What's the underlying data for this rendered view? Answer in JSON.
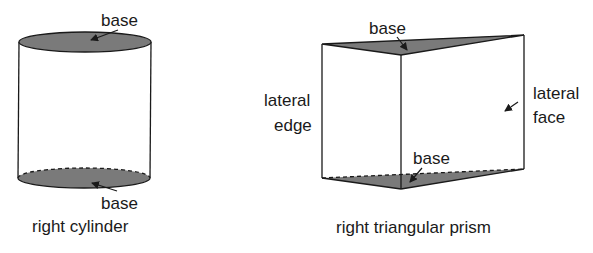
{
  "figure": {
    "cylinder": {
      "top_base_label": "base",
      "bottom_base_label": "base",
      "caption": "right cylinder"
    },
    "prism": {
      "top_base_label": "base",
      "bottom_base_label": "base",
      "lateral_edge_label_line1": "lateral",
      "lateral_edge_label_line2": "edge",
      "lateral_face_label_line1": "lateral",
      "lateral_face_label_line2": "face",
      "caption": "right triangular prism"
    },
    "colors": {
      "base_fill": "#7a7a7a",
      "stroke": "#1a1a1a"
    }
  }
}
